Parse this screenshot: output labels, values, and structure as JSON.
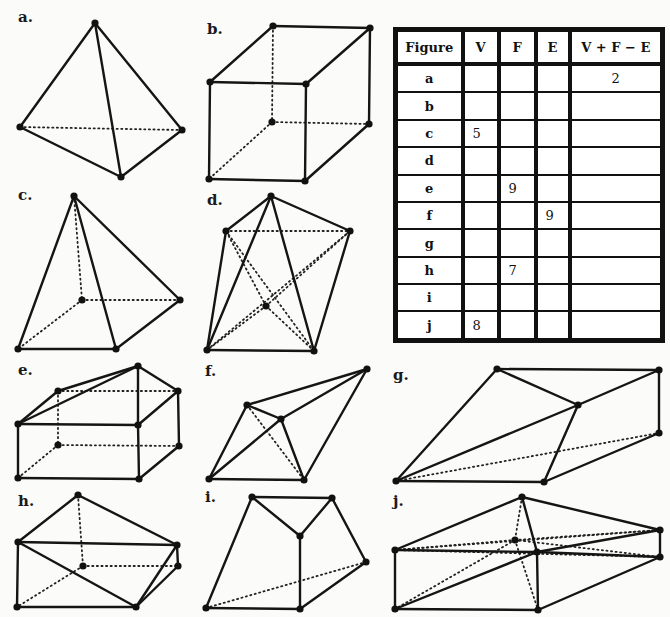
{
  "table": {
    "headers": [
      "Figure",
      "V",
      "F",
      "E",
      "V + F − E"
    ],
    "rows": [
      {
        "figure": "a",
        "V": "",
        "F": "",
        "E": "",
        "sum": "2"
      },
      {
        "figure": "b",
        "V": "",
        "F": "",
        "E": "",
        "sum": ""
      },
      {
        "figure": "c",
        "V": "5",
        "F": "",
        "E": "",
        "sum": ""
      },
      {
        "figure": "d",
        "V": "",
        "F": "",
        "E": "",
        "sum": ""
      },
      {
        "figure": "e",
        "V": "",
        "F": "9",
        "E": "",
        "sum": ""
      },
      {
        "figure": "f",
        "V": "",
        "F": "",
        "E": "9",
        "sum": ""
      },
      {
        "figure": "g",
        "V": "",
        "F": "",
        "E": "",
        "sum": ""
      },
      {
        "figure": "h",
        "V": "",
        "F": "7",
        "E": "",
        "sum": ""
      },
      {
        "figure": "i",
        "V": "",
        "F": "",
        "E": "",
        "sum": ""
      },
      {
        "figure": "j",
        "V": "8",
        "F": "",
        "E": "",
        "sum": ""
      }
    ]
  },
  "figures": [
    {
      "label": "a.",
      "label_pos": [
        18,
        22
      ],
      "vertices": [
        [
          95,
          23
        ],
        [
          20,
          127
        ],
        [
          182,
          130
        ],
        [
          121,
          177
        ]
      ],
      "edges": [
        [
          0,
          1
        ],
        [
          0,
          2
        ],
        [
          0,
          3
        ],
        [
          1,
          3
        ],
        [
          2,
          3
        ]
      ],
      "hidden": [
        [
          1,
          2
        ]
      ]
    },
    {
      "label": "b.",
      "label_pos": [
        207,
        34
      ],
      "vertices": [
        [
          273,
          26
        ],
        [
          370,
          28
        ],
        [
          210,
          82
        ],
        [
          306,
          84
        ],
        [
          272,
          122
        ],
        [
          369,
          124
        ],
        [
          209,
          179
        ],
        [
          305,
          181
        ]
      ],
      "edges": [
        [
          0,
          1
        ],
        [
          0,
          2
        ],
        [
          1,
          3
        ],
        [
          2,
          3
        ],
        [
          1,
          5
        ],
        [
          2,
          6
        ],
        [
          3,
          7
        ],
        [
          6,
          7
        ],
        [
          5,
          7
        ]
      ],
      "hidden": [
        [
          0,
          4
        ],
        [
          4,
          5
        ],
        [
          4,
          6
        ]
      ]
    },
    {
      "label": "c.",
      "label_pos": [
        18,
        200
      ],
      "vertices": [
        [
          74,
          196
        ],
        [
          82,
          300
        ],
        [
          180,
          300
        ],
        [
          18,
          349
        ],
        [
          116,
          349
        ]
      ],
      "edges": [
        [
          0,
          3
        ],
        [
          0,
          4
        ],
        [
          0,
          2
        ],
        [
          3,
          4
        ],
        [
          4,
          2
        ]
      ],
      "hidden": [
        [
          0,
          1
        ],
        [
          1,
          3
        ],
        [
          1,
          2
        ]
      ]
    },
    {
      "label": "d.",
      "label_pos": [
        207,
        205
      ],
      "vertices": [
        [
          271,
          196
        ],
        [
          226,
          231
        ],
        [
          350,
          231
        ],
        [
          266,
          306
        ],
        [
          207,
          350
        ],
        [
          314,
          351
        ]
      ],
      "edges": [
        [
          0,
          1
        ],
        [
          0,
          2
        ],
        [
          0,
          4
        ],
        [
          0,
          5
        ],
        [
          1,
          4
        ],
        [
          2,
          5
        ],
        [
          4,
          5
        ]
      ],
      "hidden": [
        [
          1,
          2
        ],
        [
          1,
          5
        ],
        [
          2,
          4
        ],
        [
          3,
          4
        ],
        [
          3,
          5
        ],
        [
          3,
          1
        ],
        [
          3,
          2
        ]
      ]
    },
    {
      "label": "e.",
      "label_pos": [
        18,
        375
      ],
      "vertices": [
        [
          138,
          366
        ],
        [
          58,
          391
        ],
        [
          178,
          391
        ],
        [
          18,
          424
        ],
        [
          138,
          425
        ],
        [
          58,
          445
        ],
        [
          179,
          446
        ],
        [
          18,
          478
        ],
        [
          139,
          479
        ]
      ],
      "edges": [
        [
          0,
          1
        ],
        [
          0,
          3
        ],
        [
          0,
          2
        ],
        [
          0,
          4
        ],
        [
          1,
          3
        ],
        [
          3,
          4
        ],
        [
          2,
          4
        ],
        [
          2,
          6
        ],
        [
          3,
          7
        ],
        [
          4,
          8
        ],
        [
          7,
          8
        ],
        [
          6,
          8
        ]
      ],
      "hidden": [
        [
          1,
          2
        ],
        [
          1,
          5
        ],
        [
          5,
          6
        ],
        [
          5,
          7
        ]
      ]
    },
    {
      "label": "f.",
      "label_pos": [
        205,
        376
      ],
      "vertices": [
        [
          367,
          369
        ],
        [
          247,
          405
        ],
        [
          281,
          419
        ],
        [
          209,
          479
        ],
        [
          304,
          480
        ]
      ],
      "edges": [
        [
          0,
          1
        ],
        [
          0,
          2
        ],
        [
          0,
          4
        ],
        [
          1,
          2
        ],
        [
          1,
          3
        ],
        [
          2,
          3
        ],
        [
          2,
          4
        ],
        [
          3,
          4
        ]
      ],
      "hidden": [
        [
          1,
          4
        ]
      ]
    },
    {
      "label": "g.",
      "label_pos": [
        393,
        380
      ],
      "vertices": [
        [
          497,
          369
        ],
        [
          659,
          370
        ],
        [
          578,
          405
        ],
        [
          659,
          433
        ],
        [
          396,
          481
        ],
        [
          544,
          482
        ]
      ],
      "edges": [
        [
          0,
          1
        ],
        [
          0,
          2
        ],
        [
          0,
          4
        ],
        [
          1,
          2
        ],
        [
          1,
          3
        ],
        [
          2,
          4
        ],
        [
          2,
          5
        ],
        [
          4,
          5
        ],
        [
          5,
          3
        ]
      ],
      "hidden": [
        [
          4,
          3
        ]
      ]
    },
    {
      "label": "h.",
      "label_pos": [
        18,
        506
      ],
      "vertices": [
        [
          78,
          495
        ],
        [
          18,
          542
        ],
        [
          177,
          545
        ],
        [
          83,
          566
        ],
        [
          178,
          566
        ],
        [
          17,
          607
        ],
        [
          136,
          607
        ]
      ],
      "edges": [
        [
          0,
          1
        ],
        [
          0,
          2
        ],
        [
          1,
          2
        ],
        [
          1,
          5
        ],
        [
          1,
          6
        ],
        [
          5,
          6
        ],
        [
          2,
          4
        ],
        [
          2,
          6
        ],
        [
          4,
          6
        ]
      ],
      "hidden": [
        [
          0,
          3
        ],
        [
          3,
          4
        ],
        [
          3,
          5
        ]
      ]
    },
    {
      "label": "i.",
      "label_pos": [
        205,
        502
      ],
      "vertices": [
        [
          252,
          497
        ],
        [
          332,
          498
        ],
        [
          300,
          536
        ],
        [
          366,
          562
        ],
        [
          206,
          608
        ],
        [
          300,
          609
        ]
      ],
      "edges": [
        [
          0,
          1
        ],
        [
          0,
          2
        ],
        [
          1,
          2
        ],
        [
          0,
          4
        ],
        [
          1,
          3
        ],
        [
          2,
          5
        ],
        [
          4,
          5
        ],
        [
          5,
          3
        ]
      ],
      "hidden": [
        [
          4,
          3
        ]
      ]
    },
    {
      "label": "j.",
      "label_pos": [
        393,
        506
      ],
      "vertices": [
        [
          522,
          497
        ],
        [
          660,
          530
        ],
        [
          515,
          540
        ],
        [
          395,
          550
        ],
        [
          537,
          552
        ],
        [
          660,
          557
        ],
        [
          395,
          609
        ],
        [
          538,
          610
        ]
      ],
      "edges": [
        [
          0,
          3
        ],
        [
          0,
          1
        ],
        [
          0,
          4
        ],
        [
          3,
          4
        ],
        [
          4,
          1
        ],
        [
          4,
          5
        ],
        [
          1,
          5
        ],
        [
          3,
          6
        ],
        [
          4,
          7
        ],
        [
          6,
          7
        ],
        [
          7,
          5
        ],
        [
          6,
          4
        ]
      ],
      "hidden": [
        [
          0,
          2
        ],
        [
          2,
          3
        ],
        [
          2,
          1
        ],
        [
          2,
          5
        ],
        [
          2,
          6
        ],
        [
          2,
          7
        ],
        [
          3,
          5
        ],
        [
          3,
          1
        ]
      ]
    }
  ]
}
